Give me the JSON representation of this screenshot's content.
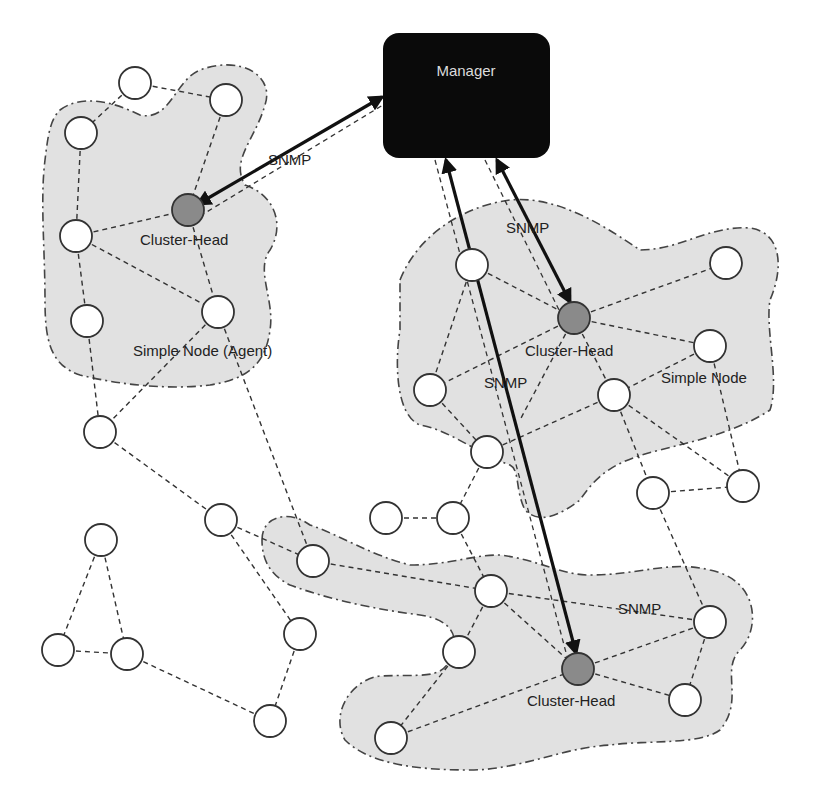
{
  "manager": {
    "label": "Manager",
    "x": 383,
    "y": 33,
    "w": 167,
    "h": 125
  },
  "colors": {
    "blob_fill": "#e1e1e1",
    "cluster_head_fill": "#8a8a8a",
    "node_fill": "#ffffff",
    "manager_fill": "#0a0a0a",
    "manager_text": "#dcdcdc"
  },
  "labels": {
    "snmp_left": "SNMP",
    "snmp_right_top": "SNMP",
    "snmp_right_mid": "SNMP",
    "snmp_bottom": "SNMP",
    "cluster_head_left": "Cluster-Head",
    "cluster_head_right": "Cluster-Head",
    "cluster_head_bottom": "Cluster-Head",
    "simple_node_agent": "Simple Node (Agent)",
    "simple_node": "Simple Node"
  },
  "clusters": [
    {
      "name": "left-cluster",
      "head": [
        188,
        210
      ]
    },
    {
      "name": "right-cluster",
      "head": [
        574,
        318
      ]
    },
    {
      "name": "bottom-cluster",
      "head": [
        578,
        669
      ]
    }
  ],
  "nodes": [
    [
      135,
      83
    ],
    [
      226,
      100
    ],
    [
      81,
      133
    ],
    [
      76,
      236
    ],
    [
      218,
      312
    ],
    [
      87,
      321
    ],
    [
      100,
      432
    ],
    [
      472,
      265
    ],
    [
      726,
      263
    ],
    [
      710,
      346
    ],
    [
      430,
      390
    ],
    [
      614,
      395
    ],
    [
      487,
      452
    ],
    [
      653,
      493
    ],
    [
      743,
      486
    ],
    [
      453,
      518
    ],
    [
      386,
      518
    ],
    [
      313,
      561
    ],
    [
      491,
      591
    ],
    [
      710,
      622
    ],
    [
      459,
      652
    ],
    [
      685,
      700
    ],
    [
      391,
      738
    ],
    [
      221,
      520
    ],
    [
      101,
      540
    ],
    [
      58,
      650
    ],
    [
      127,
      654
    ],
    [
      300,
      634
    ],
    [
      270,
      721
    ]
  ]
}
